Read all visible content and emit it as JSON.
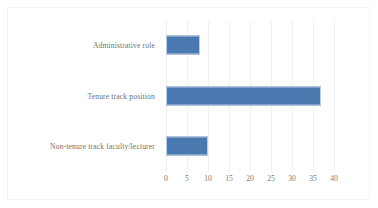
{
  "chart_data": {
    "type": "bar",
    "orientation": "horizontal",
    "title": "",
    "subtitle": "",
    "xlabel": "",
    "ylabel": "",
    "categories": [
      "Administrative role",
      "Tenure track position",
      "Non-tenure track faculty/lecturer"
    ],
    "values": [
      8,
      37,
      10
    ],
    "series": [
      {
        "name": "",
        "values": [
          8,
          37,
          10
        ],
        "color": "#4a79b0"
      }
    ],
    "xlim": [
      0,
      40
    ],
    "ylim": null,
    "xticks": [
      0,
      5,
      10,
      15,
      20,
      25,
      30,
      35,
      40
    ],
    "xtick_labels": [
      "0",
      "5",
      "10",
      "15",
      "20",
      "25",
      "30",
      "35",
      "40"
    ],
    "grid": "vertical",
    "legend": false,
    "legend_position": "none",
    "annotations": []
  },
  "style": {
    "bar_color": "#4a79b0",
    "bar_border_color": "#b9cee0",
    "gridline_color": "#f0f0f0",
    "frame_color": "#f2f2f2",
    "label_color": "#6f6f6f",
    "tick_color": "#7a7a7a",
    "background": "#ffffff"
  }
}
